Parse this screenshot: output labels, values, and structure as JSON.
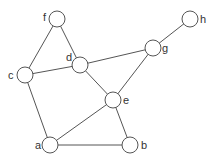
{
  "diagram": {
    "type": "undirected-graph",
    "node_radius": 8,
    "colors": {
      "stroke": "#555555",
      "fill": "#ffffff",
      "label": "#333333",
      "background": "#ffffff"
    },
    "nodes": [
      {
        "id": "a",
        "label": "a",
        "x": 50,
        "y": 145,
        "label_dx": -15,
        "label_dy": 4
      },
      {
        "id": "b",
        "label": "b",
        "x": 130,
        "y": 145,
        "label_dx": 11,
        "label_dy": 4
      },
      {
        "id": "c",
        "label": "c",
        "x": 25,
        "y": 75,
        "label_dx": -17,
        "label_dy": 4
      },
      {
        "id": "d",
        "label": "d",
        "x": 80,
        "y": 65,
        "label_dx": -14,
        "label_dy": -4
      },
      {
        "id": "e",
        "label": "e",
        "x": 113,
        "y": 100,
        "label_dx": 10,
        "label_dy": 4
      },
      {
        "id": "f",
        "label": "f",
        "x": 57,
        "y": 19,
        "label_dx": -14,
        "label_dy": 2
      },
      {
        "id": "g",
        "label": "g",
        "x": 153,
        "y": 48,
        "label_dx": 9,
        "label_dy": 4
      },
      {
        "id": "h",
        "label": "h",
        "x": 190,
        "y": 19,
        "label_dx": 10,
        "label_dy": 4
      }
    ],
    "edges": [
      [
        "f",
        "c"
      ],
      [
        "f",
        "d"
      ],
      [
        "c",
        "d"
      ],
      [
        "c",
        "a"
      ],
      [
        "d",
        "g"
      ],
      [
        "d",
        "e"
      ],
      [
        "g",
        "h"
      ],
      [
        "g",
        "e"
      ],
      [
        "e",
        "a"
      ],
      [
        "e",
        "b"
      ],
      [
        "a",
        "b"
      ]
    ]
  }
}
